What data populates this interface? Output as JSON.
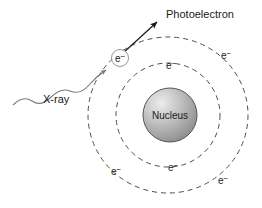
{
  "figure": {
    "background_color": "#ffffff",
    "stroke_color": "#4d4d4d",
    "text_color": "#1a1a1a"
  },
  "labels": {
    "photoelectron": "Photoelectron",
    "xray": "X-ray",
    "nucleus": "Nucleus",
    "electron": "e",
    "electron_charge": "−"
  },
  "nucleus": {
    "cx": 170,
    "cy": 115,
    "r": 27,
    "fill_light": "#e2e2e2",
    "fill_mid": "#b5b5b5",
    "fill_dark": "#8f8f8f",
    "stroke": "#555555"
  },
  "shells": [
    {
      "name": "inner-shell",
      "cx": 168,
      "cy": 115,
      "rx": 52,
      "ry": 52,
      "dash": "5 4",
      "stroke": "#4d4d4d"
    },
    {
      "name": "outer-shell",
      "cx": 168,
      "cy": 115,
      "rx": 80,
      "ry": 78,
      "dash": "5 4",
      "stroke": "#4d4d4d"
    }
  ],
  "electrons": [
    {
      "id": "ejected-electron",
      "x": 120,
      "y": 58,
      "shell": "outer",
      "circled": true
    },
    {
      "id": "outer-electron-right",
      "x": 226,
      "y": 55,
      "shell": "outer",
      "circled": false
    },
    {
      "id": "inner-electron-top",
      "x": 171,
      "y": 65,
      "shell": "inner",
      "circled": false
    },
    {
      "id": "inner-electron-bottom",
      "x": 173,
      "y": 167,
      "shell": "inner",
      "circled": false
    },
    {
      "id": "outer-electron-bottom-left",
      "x": 116,
      "y": 171,
      "shell": "outer",
      "circled": false
    },
    {
      "id": "outer-electron-bottom-right",
      "x": 223,
      "y": 180,
      "shell": "outer",
      "circled": false
    }
  ],
  "xray_wave": {
    "path": "M 13 105 C 20 98, 26 97, 32 101 C 38 105, 44 104, 50 98 C 57 91, 63 88, 70 91 C 77 94, 83 92, 89 85 C 95 78, 100 74, 105 72",
    "arrow_tip_x": 112,
    "arrow_tip_y": 66,
    "stroke": "#7a7a7a"
  },
  "photoelectron_arrow": {
    "x1": 122,
    "y1": 54,
    "x2": 158,
    "y2": 21,
    "stroke": "#1a1a1a"
  },
  "colors": {
    "line": "#4d4d4d",
    "wave": "#7a7a7a",
    "arrow": "#1a1a1a",
    "text": "#1a1a1a"
  }
}
